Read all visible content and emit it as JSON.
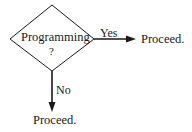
{
  "diagram": {
    "decision": {
      "label": "Programming",
      "suffix": "?"
    },
    "branches": [
      {
        "label": "Yes",
        "target": "Proceed.",
        "direction": "right"
      },
      {
        "label": "No",
        "target": "Proceed.",
        "direction": "down"
      }
    ],
    "colors": {
      "stroke": "#1a1a1a",
      "background": "#ffffff"
    }
  }
}
